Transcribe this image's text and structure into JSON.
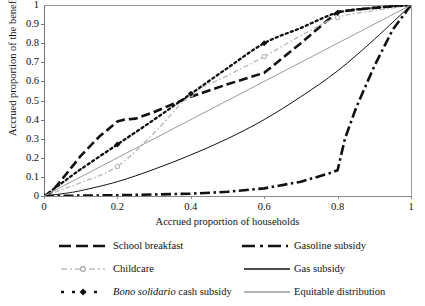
{
  "chart_data": {
    "type": "line",
    "title": "",
    "xlabel": "Accrued proportion of households",
    "ylabel": "Accrued proportion of the benefit",
    "xlim": [
      0,
      1
    ],
    "ylim": [
      0,
      1
    ],
    "xticks": [
      "0",
      "0.2",
      "0.4",
      "0.6",
      "0.8",
      "1"
    ],
    "yticks": [
      "0",
      "0.1",
      "0.2",
      "0.3",
      "0.4",
      "0.5",
      "0.6",
      "0.7",
      "0.8",
      "0.9",
      "1"
    ],
    "grid": false,
    "legend_position": "bottom",
    "series": [
      {
        "name": "School breakfast",
        "style": "long-dash",
        "color": "#111111",
        "width": 2.6,
        "marker": "none",
        "x": [
          0,
          0.02,
          0.05,
          0.1,
          0.15,
          0.2,
          0.22,
          0.25,
          0.3,
          0.35,
          0.4,
          0.5,
          0.6,
          0.7,
          0.8,
          0.9,
          1
        ],
        "y": [
          0,
          0.02,
          0.09,
          0.21,
          0.31,
          0.39,
          0.4,
          0.405,
          0.44,
          0.48,
          0.52,
          0.585,
          0.645,
          0.8,
          0.965,
          0.985,
          1
        ]
      },
      {
        "name": "Childcare",
        "style": "dash-dot-thin",
        "color": "#b9b9b9",
        "width": 1.4,
        "marker": "circle",
        "x": [
          0,
          0.05,
          0.1,
          0.2,
          0.3,
          0.4,
          0.5,
          0.6,
          0.7,
          0.8,
          0.9,
          1
        ],
        "y": [
          0,
          0.035,
          0.07,
          0.155,
          0.33,
          0.53,
          0.63,
          0.73,
          0.84,
          0.935,
          0.97,
          1
        ],
        "marker_x": [
          0.2,
          0.4,
          0.6,
          0.8
        ],
        "marker_y": [
          0.155,
          0.53,
          0.73,
          0.935
        ]
      },
      {
        "name": "Bono solidario cash subsidy",
        "style": "dotted",
        "color": "#111111",
        "width": 2.3,
        "marker": "diamond",
        "x": [
          0,
          0.05,
          0.1,
          0.2,
          0.3,
          0.4,
          0.5,
          0.6,
          0.7,
          0.8,
          0.9,
          1
        ],
        "y": [
          0,
          0.07,
          0.14,
          0.27,
          0.4,
          0.535,
          0.67,
          0.8,
          0.88,
          0.96,
          0.985,
          1
        ],
        "marker_x": [
          0.2,
          0.4,
          0.6,
          0.8
        ],
        "marker_y": [
          0.27,
          0.535,
          0.8,
          0.96
        ]
      },
      {
        "name": "Gasoline subsidy",
        "style": "dash-dot",
        "color": "#111111",
        "width": 2.6,
        "marker": "none",
        "x": [
          0,
          0.1,
          0.2,
          0.3,
          0.4,
          0.5,
          0.6,
          0.7,
          0.78,
          0.8,
          0.82,
          0.85,
          0.9,
          0.95,
          1
        ],
        "y": [
          0,
          0.002,
          0.004,
          0.008,
          0.012,
          0.022,
          0.04,
          0.075,
          0.12,
          0.135,
          0.3,
          0.46,
          0.68,
          0.87,
          1
        ]
      },
      {
        "name": "Gas subsidy",
        "style": "solid",
        "color": "#111111",
        "width": 1.0,
        "marker": "none",
        "x": [
          0,
          0.05,
          0.1,
          0.2,
          0.3,
          0.4,
          0.5,
          0.6,
          0.7,
          0.8,
          0.9,
          1
        ],
        "y": [
          0,
          0.012,
          0.028,
          0.075,
          0.14,
          0.215,
          0.3,
          0.4,
          0.52,
          0.655,
          0.82,
          1
        ]
      },
      {
        "name": "Equitable distribution",
        "style": "solid",
        "color": "#9a9a9a",
        "width": 1.0,
        "marker": "none",
        "x": [
          0,
          1
        ],
        "y": [
          0,
          1
        ]
      }
    ]
  },
  "axes": {
    "ylabel": "Accrued proportion of the benefit",
    "xlabel": "Accrued proportion of households",
    "xticks": [
      "0",
      "0.2",
      "0.4",
      "0.6",
      "0.8",
      "1"
    ],
    "yticks": [
      "1",
      "0.9",
      "0.8",
      "0.7",
      "0.6",
      "0.5",
      "0.4",
      "0.3",
      "0.2",
      "0.1",
      "0"
    ]
  },
  "legend": {
    "left_column": [
      {
        "label": "School breakfast",
        "label_pre": "",
        "label_italic": "",
        "label_post": "School breakfast",
        "swatch": "long-dash"
      },
      {
        "label": "Childcare",
        "label_pre": "",
        "label_italic": "",
        "label_post": "Childcare",
        "swatch": "dash-dot-circle"
      },
      {
        "label": "Bono solidario cash subsidy",
        "label_pre": "",
        "label_italic": "Bono solidario",
        "label_post": " cash subsidy",
        "swatch": "dotted-diamond"
      }
    ],
    "right_column": [
      {
        "label": "Gasoline subsidy",
        "label_pre": "",
        "label_italic": "",
        "label_post": "Gasoline subsidy",
        "swatch": "dash-dot"
      },
      {
        "label": "Gas subsidy",
        "label_pre": "",
        "label_italic": "",
        "label_post": "Gas subsidy",
        "swatch": "solid-black"
      },
      {
        "label": "Equitable distribution",
        "label_pre": "",
        "label_italic": "",
        "label_post": "Equitable distribution",
        "swatch": "solid-gray"
      }
    ]
  }
}
